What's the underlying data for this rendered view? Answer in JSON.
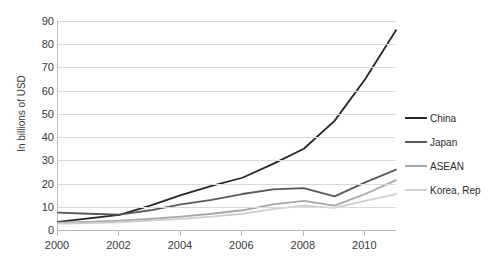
{
  "chart_data": {
    "type": "line",
    "title": "",
    "subtitle": "",
    "xlabel": "",
    "ylabel": "In billions of USD",
    "x": [
      2000,
      2001,
      2002,
      2003,
      2004,
      2005,
      2006,
      2007,
      2008,
      2009,
      2010,
      2011
    ],
    "xtick_labels": [
      "2000",
      "2002",
      "2004",
      "2006",
      "2008",
      "2010"
    ],
    "xtick_values": [
      2000,
      2002,
      2004,
      2006,
      2008,
      2010
    ],
    "ytick_labels": [
      "0",
      "10",
      "20",
      "30",
      "40",
      "50",
      "60",
      "70",
      "80",
      "90"
    ],
    "ytick_values": [
      0,
      10,
      20,
      30,
      40,
      50,
      60,
      70,
      80,
      90
    ],
    "xlim": [
      2000,
      2011
    ],
    "ylim": [
      0,
      90
    ],
    "grid": "horizontal",
    "legend_position": "right",
    "series": [
      {
        "name": "China",
        "color": "#262626",
        "values": [
          3.5,
          5.0,
          6.5,
          10.5,
          15.0,
          19.0,
          22.5,
          28.5,
          35.0,
          47.0,
          65.0,
          86.0
        ]
      },
      {
        "name": "Japan",
        "color": "#595959",
        "values": [
          7.5,
          7.0,
          6.6,
          8.5,
          11.0,
          13.0,
          15.5,
          17.5,
          18.0,
          14.5,
          20.5,
          26.0
        ]
      },
      {
        "name": "ASEAN",
        "color": "#a6a6a6",
        "values": [
          3.2,
          3.5,
          4.0,
          4.8,
          5.8,
          7.0,
          8.5,
          11.0,
          12.5,
          10.5,
          15.5,
          21.5
        ]
      },
      {
        "name": "Korea, Rep",
        "color": "#cfcfcf",
        "values": [
          2.8,
          3.0,
          3.3,
          4.0,
          4.8,
          5.8,
          7.0,
          9.0,
          10.5,
          9.5,
          12.5,
          15.5
        ]
      }
    ]
  },
  "legend": {
    "items": [
      {
        "label": "China",
        "color": "#262626"
      },
      {
        "label": "Japan",
        "color": "#595959"
      },
      {
        "label": "ASEAN",
        "color": "#a6a6a6"
      },
      {
        "label": "Korea, Rep",
        "color": "#cfcfcf"
      }
    ]
  },
  "axes": {
    "y_title": "In billions of USD"
  }
}
